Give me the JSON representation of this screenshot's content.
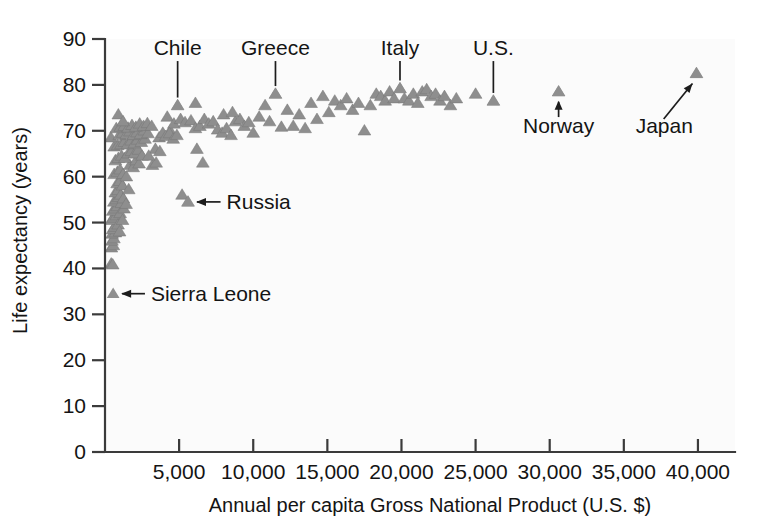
{
  "chart_data": {
    "type": "scatter",
    "title": "",
    "xlabel": "Annual per capita Gross National Product (U.S. $)",
    "ylabel": "Life expectancy (years)",
    "xlim": [
      0,
      42500
    ],
    "ylim": [
      0,
      90
    ],
    "grid": false,
    "legend": "none",
    "xticks": [
      5000,
      10000,
      15000,
      20000,
      25000,
      30000,
      35000,
      40000
    ],
    "xticklabels": [
      "5,000",
      "10,000",
      "15,000",
      "20,000",
      "25,000",
      "30,000",
      "35,000",
      "40,000"
    ],
    "yticks": [
      0,
      10,
      20,
      30,
      40,
      50,
      60,
      70,
      80,
      90
    ],
    "yticklabels": [
      "0",
      "10",
      "20",
      "30",
      "40",
      "50",
      "60",
      "70",
      "80",
      "90"
    ],
    "marker": {
      "shape": "triangle-up",
      "color": "#8e8e8e",
      "size": 11
    },
    "annotations": [
      {
        "label": "Chile",
        "x": 4900,
        "y": 75.5,
        "text_x": 4000,
        "text_y": 86.5,
        "connector": "vertical"
      },
      {
        "label": "Greece",
        "x": 11500,
        "y": 78.0,
        "text_x": 10800,
        "text_y": 86.5,
        "connector": "vertical"
      },
      {
        "label": "Italy",
        "x": 19900,
        "y": 79.2,
        "text_x": 19400,
        "text_y": 86.5,
        "connector": "vertical"
      },
      {
        "label": "U.S.",
        "x": 26200,
        "y": 76.5,
        "text_x": 25300,
        "text_y": 86.5,
        "connector": "vertical"
      },
      {
        "label": "Norway",
        "x": 30600,
        "y": 78.5,
        "text_x": 29100,
        "text_y": 69.5,
        "connector": "up-arrow"
      },
      {
        "label": "Japan",
        "x": 39900,
        "y": 82.5,
        "text_x": 35800,
        "text_y": 69.5,
        "connector": "diagonal-arrow"
      },
      {
        "label": "Russia",
        "x": 5600,
        "y": 54.5,
        "text_x": 8200,
        "text_y": 54.5,
        "connector": "left-arrow"
      },
      {
        "label": "Sierra Leone",
        "x": 550,
        "y": 34.5,
        "text_x": 3100,
        "text_y": 34.5,
        "connector": "left-arrow"
      }
    ],
    "points": [
      [
        420,
        41.0
      ],
      [
        520,
        40.8
      ],
      [
        430,
        44.5
      ],
      [
        560,
        45.0
      ],
      [
        470,
        46.0
      ],
      [
        600,
        46.5
      ],
      [
        480,
        47.5
      ],
      [
        700,
        47.8
      ],
      [
        520,
        48.5
      ],
      [
        640,
        49.0
      ],
      [
        430,
        50.5
      ],
      [
        560,
        51.0
      ],
      [
        760,
        51.5
      ],
      [
        880,
        49.5
      ],
      [
        980,
        48.0
      ],
      [
        520,
        52.5
      ],
      [
        680,
        53.0
      ],
      [
        840,
        53.5
      ],
      [
        1020,
        52.0
      ],
      [
        1180,
        50.5
      ],
      [
        600,
        54.5
      ],
      [
        760,
        55.0
      ],
      [
        920,
        55.5
      ],
      [
        1100,
        54.2
      ],
      [
        1280,
        53.0
      ],
      [
        700,
        56.5
      ],
      [
        880,
        57.0
      ],
      [
        1060,
        56.0
      ],
      [
        1240,
        55.2
      ],
      [
        1420,
        54.0
      ],
      [
        820,
        58.5
      ],
      [
        1000,
        59.0
      ],
      [
        1180,
        58.0
      ],
      [
        1600,
        57.2
      ],
      [
        620,
        60.5
      ],
      [
        840,
        61.0
      ],
      [
        1020,
        61.5
      ],
      [
        1220,
        60.5
      ],
      [
        1440,
        60.0
      ],
      [
        1680,
        62.5
      ],
      [
        1900,
        62.0
      ],
      [
        2100,
        63.5
      ],
      [
        2300,
        62.8
      ],
      [
        700,
        63.5
      ],
      [
        900,
        64.0
      ],
      [
        1120,
        64.5
      ],
      [
        1340,
        64.0
      ],
      [
        1560,
        65.0
      ],
      [
        1780,
        65.5
      ],
      [
        2000,
        65.0
      ],
      [
        2250,
        65.8
      ],
      [
        2500,
        64.5
      ],
      [
        620,
        66.5
      ],
      [
        860,
        66.8
      ],
      [
        1080,
        67.0
      ],
      [
        1300,
        67.5
      ],
      [
        1520,
        67.0
      ],
      [
        1760,
        67.8
      ],
      [
        1980,
        67.2
      ],
      [
        2200,
        68.0
      ],
      [
        2450,
        67.5
      ],
      [
        2700,
        68.2
      ],
      [
        400,
        68.5
      ],
      [
        960,
        69.0
      ],
      [
        1200,
        69.5
      ],
      [
        1440,
        69.2
      ],
      [
        1680,
        69.8
      ],
      [
        1920,
        69.0
      ],
      [
        2160,
        69.6
      ],
      [
        2400,
        69.2
      ],
      [
        2650,
        70.0
      ],
      [
        2900,
        69.4
      ],
      [
        760,
        70.5
      ],
      [
        1040,
        70.8
      ],
      [
        1300,
        71.0
      ],
      [
        1560,
        70.6
      ],
      [
        1820,
        71.2
      ],
      [
        2080,
        70.8
      ],
      [
        2340,
        71.5
      ],
      [
        2600,
        71.0
      ],
      [
        2860,
        71.6
      ],
      [
        3150,
        71.0
      ],
      [
        900,
        73.5
      ],
      [
        1220,
        72.0
      ],
      [
        3400,
        66.0
      ],
      [
        3650,
        68.5
      ],
      [
        3900,
        69.5
      ],
      [
        3200,
        62.5
      ],
      [
        3450,
        63.0
      ],
      [
        2950,
        64.5
      ],
      [
        3700,
        65.5
      ],
      [
        4200,
        73.0
      ],
      [
        4400,
        70.0
      ],
      [
        4650,
        71.5
      ],
      [
        4900,
        75.5
      ],
      [
        4100,
        68.8
      ],
      [
        4350,
        69.4
      ],
      [
        4600,
        68.2
      ],
      [
        4850,
        69.0
      ],
      [
        5200,
        56.0
      ],
      [
        5600,
        54.5
      ],
      [
        5100,
        72.5
      ],
      [
        5400,
        71.8
      ],
      [
        5800,
        72.2
      ],
      [
        6100,
        70.5
      ],
      [
        6400,
        71.0
      ],
      [
        6100,
        76.0
      ],
      [
        6700,
        72.5
      ],
      [
        7000,
        71.5
      ],
      [
        7300,
        72.0
      ],
      [
        7600,
        70.2
      ],
      [
        6200,
        66.0
      ],
      [
        6600,
        63.0
      ],
      [
        7900,
        69.5
      ],
      [
        8200,
        70.5
      ],
      [
        8500,
        69.0
      ],
      [
        8800,
        72.0
      ],
      [
        9100,
        72.5
      ],
      [
        9400,
        71.0
      ],
      [
        9700,
        71.8
      ],
      [
        10000,
        69.5
      ],
      [
        8000,
        73.5
      ],
      [
        8600,
        74.0
      ],
      [
        10400,
        73.0
      ],
      [
        10800,
        75.5
      ],
      [
        11100,
        72.0
      ],
      [
        11500,
        78.0
      ],
      [
        11900,
        70.8
      ],
      [
        12300,
        74.5
      ],
      [
        12700,
        71.0
      ],
      [
        13100,
        73.5
      ],
      [
        13500,
        70.5
      ],
      [
        13900,
        76.0
      ],
      [
        14300,
        72.5
      ],
      [
        14700,
        77.5
      ],
      [
        15100,
        74.0
      ],
      [
        15500,
        76.5
      ],
      [
        15900,
        75.5
      ],
      [
        16300,
        77.0
      ],
      [
        16700,
        74.5
      ],
      [
        17100,
        76.0
      ],
      [
        17500,
        70.0
      ],
      [
        17900,
        75.5
      ],
      [
        18300,
        78.0
      ],
      [
        18600,
        77.5
      ],
      [
        18900,
        76.5
      ],
      [
        19200,
        78.5
      ],
      [
        19500,
        77.0
      ],
      [
        19900,
        79.2
      ],
      [
        20200,
        77.0
      ],
      [
        20500,
        76.5
      ],
      [
        20800,
        78.0
      ],
      [
        21100,
        76.0
      ],
      [
        21400,
        78.5
      ],
      [
        21700,
        79.0
      ],
      [
        22000,
        77.5
      ],
      [
        22300,
        78.0
      ],
      [
        22600,
        76.5
      ],
      [
        22900,
        77.5
      ],
      [
        23300,
        75.5
      ],
      [
        23700,
        77.0
      ],
      [
        25000,
        78.0
      ],
      [
        26200,
        76.5
      ],
      [
        30600,
        78.5
      ],
      [
        39900,
        82.5
      ]
    ]
  },
  "axes": {
    "y_axis_title": "Life expectancy (years)",
    "x_axis_title": "Annual per capita Gross National Product (U.S. $)"
  }
}
